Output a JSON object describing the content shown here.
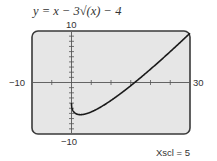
{
  "title": "y = x − 3√(x) − 4",
  "labels": {
    "ymax": "10",
    "ymin": "−10",
    "xmin": "−10",
    "xmax": "30",
    "xscl": "Xscl = 5"
  },
  "colors": {
    "frame": "#3a3a3a",
    "background": "#e6e6e6",
    "curve": "#1a1a1a",
    "axis": "#555555"
  },
  "chart_data": {
    "type": "line",
    "title": "y = x − 3√(x) − 4",
    "xlabel": "",
    "ylabel": "",
    "xlim": [
      -10,
      30
    ],
    "ylim": [
      -10,
      10
    ],
    "xscl": 5,
    "yscl": 1,
    "grid": false,
    "series": [
      {
        "name": "y = x - 3*sqrt(x) - 4",
        "x": [
          0,
          0.25,
          1,
          2.25,
          4,
          6.25,
          9,
          12.25,
          16,
          20.25,
          25,
          30
        ],
        "y": [
          -4,
          -5.5,
          -6,
          -6.25,
          -6,
          -5.25,
          -4,
          -2.25,
          0,
          2.25,
          5,
          9.57
        ]
      }
    ]
  }
}
